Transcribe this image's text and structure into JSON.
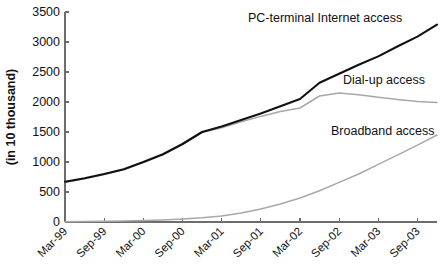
{
  "chart_data": {
    "type": "line",
    "title": "",
    "xlabel": "",
    "ylabel": "(in 10 thousand)",
    "ylim": [
      0,
      3500
    ],
    "yticks": [
      0,
      500,
      1000,
      1500,
      2000,
      2500,
      3000,
      3500
    ],
    "ytick_labels": [
      "0",
      "500",
      "1000",
      "1500",
      "2000",
      "2500",
      "3000",
      "3500"
    ],
    "grid": false,
    "legend_position": "inline-annotations",
    "x": [
      "Mar-99",
      "Jun-99",
      "Sep-99",
      "Dec-99",
      "Mar-00",
      "Jun-00",
      "Sep-00",
      "Dec-00",
      "Mar-01",
      "Jun-01",
      "Sep-01",
      "Dec-01",
      "Mar-02",
      "Jun-02",
      "Sep-02",
      "Dec-02",
      "Mar-03",
      "Jun-03",
      "Sep-03",
      "Dec-03"
    ],
    "xtick_labels": [
      "Mar-99",
      "Sep-99",
      "Mar-00",
      "Sep-00",
      "Mar-01",
      "Sep-01",
      "Mar-02",
      "Sep-02",
      "Mar-03",
      "Sep-03"
    ],
    "xtick_indices": [
      0,
      2,
      4,
      6,
      8,
      10,
      12,
      14,
      16,
      18
    ],
    "series": [
      {
        "name": "PC-terminal Internet access",
        "color": "#111111",
        "style": "thick",
        "values": [
          670,
          730,
          800,
          880,
          1000,
          1130,
          1300,
          1500,
          1590,
          1700,
          1810,
          1930,
          2050,
          2320,
          2470,
          2620,
          2760,
          2930,
          3090,
          3290
        ]
      },
      {
        "name": "Dial-up access",
        "color": "#a8a8a8",
        "style": "thin",
        "values": [
          660,
          720,
          790,
          870,
          990,
          1120,
          1290,
          1490,
          1570,
          1670,
          1760,
          1840,
          1900,
          2100,
          2150,
          2120,
          2080,
          2040,
          2010,
          1990
        ]
      },
      {
        "name": "Broadband access",
        "color": "#a8a8a8",
        "style": "thin",
        "values": [
          5,
          8,
          12,
          18,
          25,
          35,
          50,
          70,
          100,
          150,
          215,
          300,
          400,
          520,
          660,
          800,
          960,
          1120,
          1280,
          1450
        ]
      }
    ],
    "annotations": [
      {
        "text": "PC-terminal Internet access",
        "x_px": 248,
        "y_px": 22
      },
      {
        "text": "Dial-up access",
        "x_px": 343,
        "y_px": 84
      },
      {
        "text": "Broadband access",
        "x_px": 331,
        "y_px": 135
      }
    ]
  }
}
